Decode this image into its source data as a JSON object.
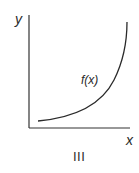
{
  "figure": {
    "panel_label": "III",
    "axes": {
      "x_label": "x",
      "y_label": "y"
    },
    "curve_label": "f(x)"
  },
  "colors": {
    "ink": "#2a2a2a",
    "background": "#ffffff"
  }
}
